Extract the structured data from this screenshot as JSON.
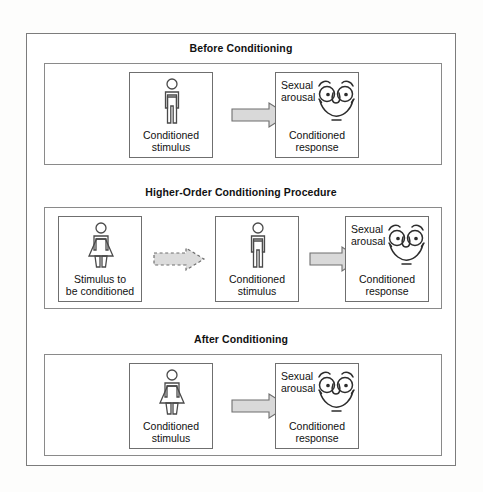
{
  "diagram": {
    "line_color": "#6f6f6f",
    "arrow_fill": "#d9d9d9",
    "arrow_stroke": "#6f6f6f",
    "stages": [
      {
        "id": "before-conditioning",
        "title": "Before Conditioning",
        "items": [
          {
            "id": "cs-male",
            "icon": "male-figure-icon",
            "caption_line1": "Conditioned",
            "caption_line2": "stimulus"
          },
          {
            "id": "cr-face",
            "icon": "smiley-face-icon",
            "corner_line1": "Sexual",
            "corner_line2": "arousal",
            "caption_line1": "Conditioned",
            "caption_line2": "response"
          }
        ],
        "arrows": [
          {
            "id": "solid-arrow-1",
            "style": "solid"
          }
        ]
      },
      {
        "id": "higher-order-conditioning-procedure",
        "title": "Higher-Order Conditioning Procedure",
        "items": [
          {
            "id": "stimulus-to-be-conditioned-female",
            "icon": "female-figure-icon",
            "caption_line1": "Stimulus to",
            "caption_line2": "be conditioned"
          },
          {
            "id": "cs-male",
            "icon": "male-figure-icon",
            "caption_line1": "Conditioned",
            "caption_line2": "stimulus"
          },
          {
            "id": "cr-face",
            "icon": "smiley-face-icon",
            "corner_line1": "Sexual",
            "corner_line2": "arousal",
            "caption_line1": "Conditioned",
            "caption_line2": "response"
          }
        ],
        "arrows": [
          {
            "id": "dashed-arrow-1",
            "style": "dashed"
          },
          {
            "id": "solid-arrow-2",
            "style": "solid"
          }
        ]
      },
      {
        "id": "after-conditioning",
        "title": "After Conditioning",
        "items": [
          {
            "id": "cs-female",
            "icon": "female-figure-icon",
            "caption_line1": "Conditioned",
            "caption_line2": "stimulus"
          },
          {
            "id": "cr-face",
            "icon": "smiley-face-icon",
            "corner_line1": "Sexual",
            "corner_line2": "arousal",
            "caption_line1": "Conditioned",
            "caption_line2": "response"
          }
        ],
        "arrows": [
          {
            "id": "solid-arrow-3",
            "style": "solid"
          }
        ]
      }
    ]
  }
}
